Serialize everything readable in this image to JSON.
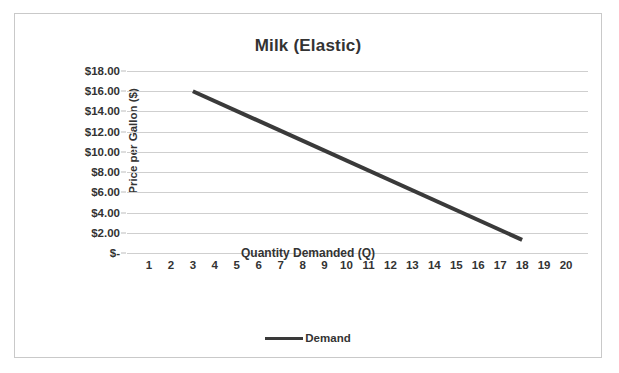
{
  "chart_data": {
    "type": "line",
    "title": "Milk (Elastic)",
    "xlabel": "Quantity Demanded (Q)",
    "ylabel": "Price per Gallon ($)",
    "xlim": [
      0,
      21
    ],
    "ylim": [
      0,
      18
    ],
    "grid": true,
    "legend_position": "bottom",
    "x_tick_labels": [
      "1",
      "2",
      "3",
      "4",
      "5",
      "6",
      "7",
      "8",
      "9",
      "10",
      "11",
      "12",
      "13",
      "14",
      "15",
      "16",
      "17",
      "18",
      "19",
      "20"
    ],
    "x_tick_values": [
      1,
      2,
      3,
      4,
      5,
      6,
      7,
      8,
      9,
      10,
      11,
      12,
      13,
      14,
      15,
      16,
      17,
      18,
      19,
      20
    ],
    "y_tick_labels": [
      "$18.00",
      "$16.00",
      "$14.00",
      "$12.00",
      "$10.00",
      "$8.00",
      "$6.00",
      "$4.00",
      "$2.00",
      "$-"
    ],
    "y_tick_values": [
      18,
      16,
      14,
      12,
      10,
      8,
      6,
      4,
      2,
      0
    ],
    "series": [
      {
        "name": "Demand",
        "color": "#3a3a3a",
        "line_width": 4,
        "x": [
          3,
          18
        ],
        "values": [
          16.0,
          1.3
        ]
      }
    ]
  },
  "legend": {
    "entries": [
      {
        "label": "Demand",
        "color": "#3a3a3a"
      }
    ]
  },
  "colors": {
    "series": "#3a3a3a",
    "gridline": "#cfcfcf",
    "frame_border": "#c9c9c9",
    "text": "#333333",
    "background": "#ffffff"
  }
}
